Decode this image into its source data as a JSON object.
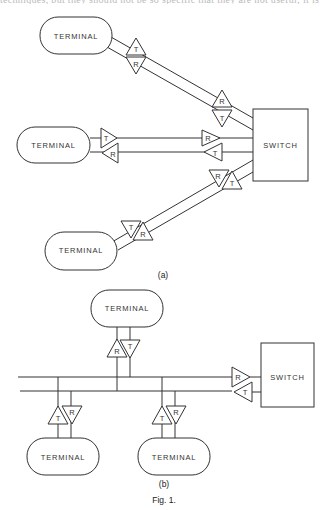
{
  "header_clipped_text": "techniques, but they should not be so specific that they are not useful; it is",
  "figure": {
    "caption": "Fig. 1.",
    "panel_a": {
      "label": "(a)",
      "terminals": [
        {
          "label": "TERMINAL",
          "transceiver_near": [
            "T",
            "R"
          ],
          "transceiver_far": [
            "R",
            "T"
          ]
        },
        {
          "label": "TERMINAL",
          "transceiver_near": [
            "T",
            "R"
          ],
          "transceiver_far": [
            "R",
            "T"
          ]
        },
        {
          "label": "TERMINAL",
          "transceiver_near": [
            "T",
            "R"
          ],
          "transceiver_far": [
            "R",
            "T"
          ]
        }
      ],
      "switch": {
        "label": "SWITCH"
      }
    },
    "panel_b": {
      "label": "(b)",
      "terminals": [
        {
          "label": "TERMINAL",
          "position": "top",
          "transceiver": [
            "R",
            "T"
          ]
        },
        {
          "label": "TERMINAL",
          "position": "bottom-left",
          "transceiver": [
            "T",
            "R"
          ]
        },
        {
          "label": "TERMINAL",
          "position": "bottom-right",
          "transceiver": [
            "T",
            "R"
          ]
        }
      ],
      "switch": {
        "label": "SWITCH",
        "transceiver": [
          "R",
          "T"
        ]
      }
    }
  }
}
